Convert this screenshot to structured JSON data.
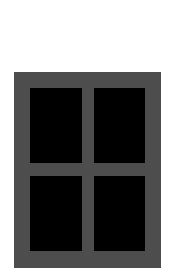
{
  "image": {
    "subject": "window-icon",
    "colors": {
      "background": "#ffffff",
      "frame": "#4d4d4d",
      "pane": "#000000"
    },
    "panes": [
      {
        "position": "top-left"
      },
      {
        "position": "top-right"
      },
      {
        "position": "bottom-left"
      },
      {
        "position": "bottom-right"
      }
    ]
  }
}
